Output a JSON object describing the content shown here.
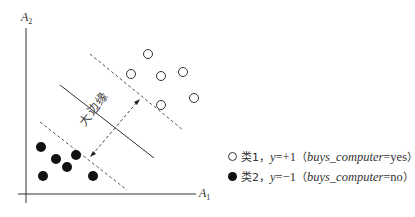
{
  "diagram": {
    "axes": {
      "x_label": "A",
      "x_sub": "1",
      "y_label": "A",
      "y_sub": "2"
    },
    "margin_label": "大边缘",
    "class1_points": [
      [
        148,
        54
      ],
      [
        131,
        74
      ],
      [
        161,
        76
      ],
      [
        183,
        72
      ],
      [
        161,
        105
      ],
      [
        194,
        98
      ]
    ],
    "class2_points": [
      [
        41,
        147
      ],
      [
        56,
        159
      ],
      [
        76,
        155
      ],
      [
        67,
        167
      ],
      [
        43,
        176
      ],
      [
        93,
        176
      ]
    ],
    "lines": {
      "hyperplane": [
        [
          60,
          85
        ],
        [
          154,
          158
        ]
      ],
      "upper_margin": [
        [
          90,
          54
        ],
        [
          183,
          130
        ]
      ],
      "lower_margin": [
        [
          40,
          122
        ],
        [
          127,
          190
        ]
      ],
      "margin_arrow": [
        [
          90,
          157
        ],
        [
          140,
          99
        ]
      ]
    },
    "legend": {
      "class1": {
        "name": "类1",
        "sep": "，",
        "y_var": "y",
        "y_val": "=+1",
        "paren_open": "（",
        "attr": "buys_computer",
        "attr_val": "=yes",
        "paren_close": "）"
      },
      "class2": {
        "name": "类2",
        "sep": "，",
        "y_var": "y",
        "y_val": "=−1",
        "paren_open": "（",
        "attr": "buys_computer",
        "attr_val": "=no",
        "paren_close": "）"
      }
    },
    "colors": {
      "stroke": "#333333",
      "filled": "#111111"
    }
  }
}
